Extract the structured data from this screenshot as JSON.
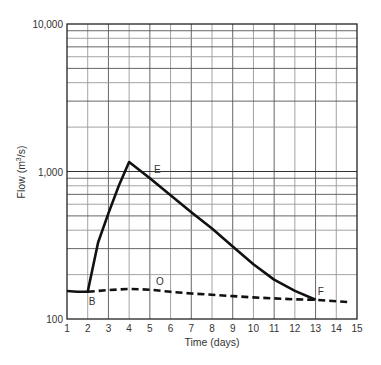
{
  "chart_data": {
    "type": "line",
    "title": "",
    "xlabel": "Time (days)",
    "ylabel": "Flow (m³/s)",
    "ylabel_parts": {
      "prefix": "Flow (m",
      "sup": "3",
      "suffix": "/s)"
    },
    "xlim": [
      1,
      15
    ],
    "ylim": [
      100,
      10000
    ],
    "yscale": "log",
    "grid": true,
    "x_ticks": [
      "1",
      "2",
      "3",
      "4",
      "5",
      "6",
      "7",
      "8",
      "9",
      "10",
      "11",
      "12",
      "13",
      "14",
      "15"
    ],
    "y_ticks": [
      {
        "value": 100,
        "label": "100"
      },
      {
        "value": 1000,
        "label": "1,000"
      },
      {
        "value": 10000,
        "label": "10,000"
      }
    ],
    "series": [
      {
        "name": "Hydrograph (total flow)",
        "style": "solid",
        "points": [
          [
            1,
            155
          ],
          [
            1.5,
            153
          ],
          [
            2,
            153
          ],
          [
            2.5,
            330
          ],
          [
            3,
            520
          ],
          [
            3.5,
            800
          ],
          [
            4,
            1160
          ],
          [
            5,
            900
          ],
          [
            6,
            690
          ],
          [
            7,
            530
          ],
          [
            8,
            410
          ],
          [
            9,
            310
          ],
          [
            10,
            235
          ],
          [
            11,
            185
          ],
          [
            12,
            155
          ],
          [
            13,
            135
          ]
        ]
      },
      {
        "name": "Baseflow",
        "style": "dashed",
        "points": [
          [
            2,
            153
          ],
          [
            3,
            157
          ],
          [
            4,
            160
          ],
          [
            5,
            158
          ],
          [
            6,
            153
          ],
          [
            7,
            149
          ],
          [
            8,
            146
          ],
          [
            9,
            143
          ],
          [
            10,
            140
          ],
          [
            11,
            138
          ],
          [
            12,
            136
          ],
          [
            13,
            135
          ],
          [
            14,
            132
          ],
          [
            14.6,
            130
          ]
        ]
      }
    ],
    "annotations": [
      {
        "label": "B",
        "x": 2.05,
        "y": 125
      },
      {
        "label": "E",
        "x": 5.2,
        "y": 980
      },
      {
        "label": "O",
        "x": 5.3,
        "y": 170
      },
      {
        "label": "F",
        "x": 13.1,
        "y": 145
      }
    ]
  },
  "colors": {
    "line": "#111111",
    "grid": "#444444",
    "grid_light": "#9a9a9a",
    "text": "#333333"
  }
}
